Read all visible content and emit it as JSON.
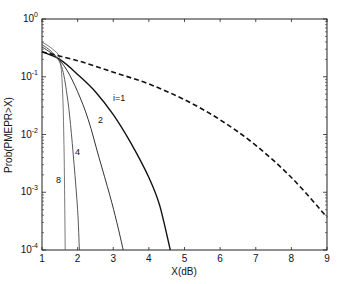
{
  "chart_data": {
    "type": "line",
    "title": "",
    "xlabel": "X(dB)",
    "ylabel": "Prob(PMEPR>X)",
    "xlim": [
      1,
      9
    ],
    "ylim": [
      0.0001,
      1
    ],
    "yscale": "log",
    "grid": false,
    "x_ticks": [
      "1",
      "2",
      "3",
      "4",
      "5",
      "6",
      "7",
      "8",
      "9"
    ],
    "y_ticks": [
      {
        "base": "10",
        "exp": "0",
        "value": 1
      },
      {
        "base": "10",
        "exp": "-1",
        "value": 0.1
      },
      {
        "base": "10",
        "exp": "-2",
        "value": 0.01
      },
      {
        "base": "10",
        "exp": "-3",
        "value": 0.001
      },
      {
        "base": "10",
        "exp": "-4",
        "value": 0.0001
      }
    ],
    "series": [
      {
        "name": "i=1",
        "label": "i=1",
        "style": "solid",
        "width": 1.4,
        "color": "#111111",
        "x": [
          1,
          1.5,
          2,
          2.5,
          3,
          3.5,
          4,
          4.3,
          4.6
        ],
        "y": [
          0.27,
          0.2,
          0.11,
          0.055,
          0.022,
          0.007,
          0.0018,
          0.0006,
          0.0001
        ],
        "label_pos": [
          113,
          101
        ]
      },
      {
        "name": "i=2",
        "label": "2",
        "style": "solid",
        "width": 1.0,
        "color": "#333333",
        "x": [
          1,
          1.4,
          1.7,
          2,
          2.3,
          2.6,
          2.9,
          3.1,
          3.28
        ],
        "y": [
          0.33,
          0.22,
          0.13,
          0.055,
          0.018,
          0.004,
          0.0009,
          0.0003,
          0.0001
        ],
        "label_pos": [
          98,
          123
        ]
      },
      {
        "name": "i=4",
        "label": "4",
        "style": "solid",
        "width": 0.9,
        "color": "#444444",
        "x": [
          1,
          1.3,
          1.55,
          1.7,
          1.8,
          1.9,
          2.0,
          2.05
        ],
        "y": [
          0.36,
          0.26,
          0.15,
          0.05,
          0.015,
          0.003,
          0.0005,
          0.0001
        ],
        "label_pos": [
          75,
          155
        ]
      },
      {
        "name": "i=8",
        "label": "8",
        "style": "solid",
        "width": 0.8,
        "color": "#555555",
        "x": [
          1,
          1.3,
          1.5,
          1.58,
          1.62,
          1.64,
          1.65
        ],
        "y": [
          0.4,
          0.3,
          0.2,
          0.05,
          0.005,
          0.0005,
          0.0001
        ],
        "label_pos": [
          56,
          183
        ]
      },
      {
        "name": "original",
        "label": "",
        "style": "dashed",
        "width": 1.6,
        "color": "#111111",
        "x": [
          1,
          2,
          3,
          4,
          5,
          6,
          7,
          8,
          9
        ],
        "y": [
          0.27,
          0.19,
          0.12,
          0.075,
          0.04,
          0.018,
          0.0065,
          0.0018,
          0.00037
        ]
      }
    ]
  }
}
